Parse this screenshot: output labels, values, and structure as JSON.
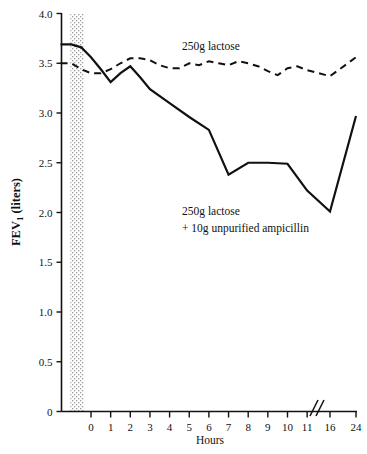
{
  "chart_data": {
    "type": "line",
    "title": "",
    "xlabel": "Hours",
    "ylabel": "FEV1 (liters)",
    "ylabel_main": "FEV",
    "ylabel_sub": "1",
    "ylabel_unit": " (liters)",
    "xlim": [
      -1.6,
      25.2
    ],
    "ylim": [
      0,
      4.0
    ],
    "grid": false,
    "legend_position": "inline-annotations",
    "axis_break": {
      "present": true,
      "between": [
        11,
        16
      ],
      "symbol": "//"
    },
    "shaded_band": {
      "label": "",
      "x_start": -1.05,
      "x_end": -0.35,
      "pattern": "stipple",
      "color": "#b9b9b9"
    },
    "yticks": [
      0,
      0.5,
      1.0,
      1.5,
      2.0,
      2.5,
      3.0,
      3.5,
      4.0
    ],
    "ytick_labels": [
      "0",
      "0.5",
      "1.0",
      "1.5",
      "2.0",
      "2.5",
      "3.0",
      "3.5",
      "4.0"
    ],
    "xticks": [
      0,
      1,
      2,
      3,
      4,
      5,
      6,
      7,
      8,
      9,
      10,
      11,
      16,
      24
    ],
    "xtick_labels": [
      "0",
      "1",
      "2",
      "3",
      "4",
      "5",
      "6",
      "7",
      "8",
      "9",
      "10",
      "11",
      "16",
      "24"
    ],
    "series": [
      {
        "name": "250g lactose",
        "style": "dashed",
        "color": "#111111",
        "x": [
          -1.55,
          -1.0,
          -0.5,
          0.0,
          0.5,
          1.0,
          1.5,
          2.0,
          2.5,
          3.0,
          3.5,
          4.0,
          4.5,
          5.0,
          5.5,
          6.0,
          6.5,
          7.0,
          7.5,
          8.0,
          8.5,
          9.0,
          9.5,
          10.0,
          10.5,
          11.0,
          16.0,
          24.0
        ],
        "values": [
          3.5,
          3.5,
          3.44,
          3.4,
          3.4,
          3.44,
          3.5,
          3.55,
          3.55,
          3.53,
          3.48,
          3.45,
          3.45,
          3.5,
          3.48,
          3.52,
          3.5,
          3.48,
          3.52,
          3.5,
          3.47,
          3.42,
          3.38,
          3.45,
          3.47,
          3.43,
          3.37,
          3.56
        ]
      },
      {
        "name": "250g lactose + 10g unpurified ampicillin",
        "style": "solid",
        "color": "#111111",
        "x": [
          -1.55,
          -1.0,
          -0.5,
          0.0,
          0.5,
          1.0,
          1.5,
          2.0,
          2.5,
          3.0,
          4.0,
          5.0,
          6.0,
          7.0,
          8.0,
          9.0,
          10.0,
          11.0,
          16.0,
          24.0
        ],
        "values": [
          3.69,
          3.69,
          3.66,
          3.56,
          3.44,
          3.31,
          3.4,
          3.47,
          3.36,
          3.24,
          3.1,
          2.96,
          2.83,
          2.38,
          2.5,
          2.5,
          2.49,
          2.22,
          2.01,
          2.97
        ]
      }
    ],
    "annotations": [
      {
        "name": "annotation-lactose",
        "lines": [
          "250g lactose"
        ],
        "x": 4.7,
        "y": 3.8
      },
      {
        "name": "annotation-ampicillin",
        "lines": [
          "250g lactose",
          "+ 10g unpurified ampicillin"
        ],
        "x": 4.7,
        "y": 2.16
      }
    ]
  },
  "axis": {
    "y_title_main": "FEV",
    "y_title_sub": "1",
    "y_title_rest": " (liters)",
    "x_title": "Hours"
  },
  "ytick_text": {
    "t0": "0",
    "t1": "0.5",
    "t2": "1.0",
    "t3": "1.5",
    "t4": "2.0",
    "t5": "2.5",
    "t6": "3.0",
    "t7": "3.5",
    "t8": "4.0"
  },
  "xtick_text": {
    "t0": "0",
    "t1": "1",
    "t2": "2",
    "t3": "3",
    "t4": "4",
    "t5": "5",
    "t6": "6",
    "t7": "7",
    "t8": "8",
    "t9": "9",
    "t10": "10",
    "t11": "11",
    "t16": "16",
    "t24": "24"
  },
  "annotation_text": {
    "lactose": "250g lactose",
    "amp_line1": "250g lactose",
    "amp_line2": "+ 10g unpurified ampicillin"
  }
}
